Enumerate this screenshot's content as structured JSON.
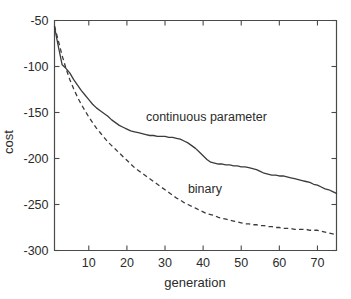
{
  "chart_data": {
    "type": "line",
    "title": "",
    "xlabel": "generation",
    "ylabel": "cost",
    "xlim": [
      1,
      75
    ],
    "ylim": [
      -300,
      -50
    ],
    "grid": false,
    "legend_position": "inline-annotations",
    "xticks": [
      10,
      20,
      30,
      40,
      50,
      60,
      70
    ],
    "xtick_labels": [
      "10",
      "20",
      "30",
      "40",
      "50",
      "60",
      "70"
    ],
    "yticks": [
      -50,
      -100,
      -150,
      -200,
      -250,
      -300
    ],
    "ytick_labels": [
      "-50",
      "-100",
      "-150",
      "-200",
      "-250",
      "-300"
    ],
    "x": [
      1,
      2,
      3,
      4,
      5,
      6,
      7,
      8,
      9,
      10,
      11,
      12,
      13,
      14,
      15,
      16,
      17,
      18,
      19,
      20,
      21,
      22,
      23,
      24,
      25,
      26,
      27,
      28,
      29,
      30,
      31,
      32,
      33,
      34,
      35,
      36,
      37,
      38,
      39,
      40,
      41,
      42,
      43,
      44,
      45,
      46,
      47,
      48,
      49,
      50,
      51,
      52,
      53,
      54,
      55,
      56,
      57,
      58,
      59,
      60,
      61,
      62,
      63,
      64,
      65,
      66,
      67,
      68,
      69,
      70,
      71,
      72,
      73,
      74,
      75
    ],
    "series": [
      {
        "name": "continuous parameter",
        "style": "solid",
        "color": "#3b3b3b",
        "label_x": 25,
        "label_y": -159,
        "values": [
          -57,
          -78,
          -98,
          -102,
          -107,
          -114,
          -120,
          -126,
          -131,
          -136,
          -141,
          -145,
          -148,
          -151,
          -154,
          -158,
          -161,
          -164,
          -166,
          -168,
          -170,
          -171,
          -172,
          -173,
          -174,
          -175,
          -175,
          -176,
          -176,
          -176,
          -177,
          -177,
          -178,
          -179,
          -181,
          -183,
          -186,
          -189,
          -193,
          -197,
          -201,
          -204,
          -205,
          -206,
          -206,
          -207,
          -207,
          -208,
          -208,
          -209,
          -209,
          -210,
          -211,
          -212,
          -214,
          -216,
          -217,
          -218,
          -218,
          -219,
          -219,
          -220,
          -221,
          -222,
          -223,
          -224,
          -225,
          -226,
          -228,
          -229,
          -231,
          -233,
          -234,
          -236,
          -238
        ]
      },
      {
        "name": "binary",
        "style": "dashed",
        "color": "#3b3b3b",
        "label_x": 36,
        "label_y": -238,
        "values": [
          -56,
          -72,
          -88,
          -102,
          -114,
          -124,
          -133,
          -141,
          -148,
          -155,
          -161,
          -167,
          -172,
          -177,
          -182,
          -186,
          -190,
          -194,
          -198,
          -202,
          -206,
          -210,
          -213,
          -216,
          -219,
          -222,
          -225,
          -228,
          -231,
          -234,
          -237,
          -240,
          -243,
          -245,
          -248,
          -250,
          -252,
          -254,
          -256,
          -258,
          -260,
          -261,
          -262,
          -264,
          -265,
          -266,
          -267,
          -268,
          -269,
          -270,
          -271,
          -271,
          -272,
          -272,
          -273,
          -273,
          -274,
          -274,
          -275,
          -275,
          -276,
          -276,
          -276,
          -277,
          -277,
          -277,
          -277,
          -278,
          -278,
          -278,
          -279,
          -280,
          -281,
          -282,
          -283
        ]
      }
    ]
  },
  "axis": {
    "x_title": "generation",
    "y_title": "cost"
  },
  "annotations": {
    "continuous_label": "continuous parameter",
    "binary_label": "binary"
  },
  "colors": {
    "line": "#3b3b3b",
    "axis": "#4a4a4a",
    "text": "#2b2b2b",
    "background": "#ffffff"
  }
}
